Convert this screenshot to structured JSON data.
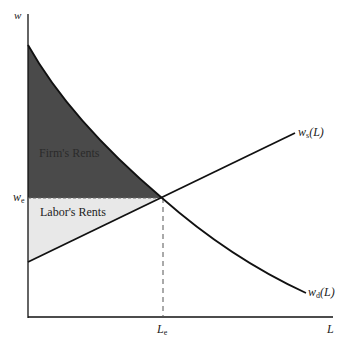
{
  "axes": {
    "y_label": "w",
    "x_label": "L",
    "we_label": "w",
    "we_sub": "e",
    "le_label": "L",
    "le_sub": "e"
  },
  "curves": {
    "supply_label": "w",
    "supply_sub": "s",
    "supply_arg": "(L)",
    "demand_label": "w",
    "demand_sub": "d",
    "demand_arg": "(L)"
  },
  "regions": {
    "firm_rents": "Firm's Rents",
    "labor_rents": "Labor's Rents"
  },
  "colors": {
    "firm_fill": "#4a4a4a",
    "labor_fill": "#e6e6e6",
    "line": "#111111"
  }
}
